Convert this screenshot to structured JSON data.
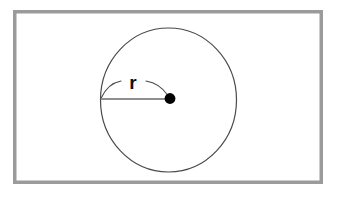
{
  "figure": {
    "kind": "geometry-diagram",
    "width": 339,
    "height": 200,
    "background_color": "#ffffff"
  },
  "frame": {
    "name": "outer-border",
    "x": 13,
    "y": 10,
    "width": 310,
    "height": 174,
    "stroke_color": "#9b9b9b",
    "stroke_width": 3.5,
    "fill_color": "#ffffff"
  },
  "circle": {
    "name": "circle-outline",
    "center_x": 168.5,
    "center_y": 100,
    "radius_x": 68,
    "radius_y": 72,
    "stroke_color": "#4a4a4a",
    "stroke_width": 1.2,
    "fill_color": "none"
  },
  "center_point": {
    "name": "center-dot",
    "x": 170,
    "y": 98.5,
    "radius": 5.4,
    "fill_color": "#000000"
  },
  "radius_line": {
    "name": "radius-segment",
    "x1": 100.8,
    "y1": 99,
    "x2": 170,
    "y2": 99,
    "stroke_color": "#8f8f8f",
    "stroke_width": 2.2
  },
  "radius_arc": {
    "name": "radius-dimension-arc",
    "left_segment_path": "M 101.5 97.5 Q 108 83.5 121 81",
    "right_segment_path": "M 146 81 Q 160 83.5 167.5 95",
    "stroke_color": "#4a4a4a",
    "stroke_width": 1.1,
    "fill_color": "none"
  },
  "labels": {
    "radius": {
      "name": "radius-label",
      "text": "r",
      "x": 133,
      "y": 89,
      "font_size": 19,
      "font_weight": "bold",
      "color": "#111111"
    }
  },
  "colors": {
    "border_gray": "#9b9b9b",
    "line_gray": "#8f8f8f",
    "outline_gray": "#4a4a4a",
    "dot_black": "#000000",
    "page_white": "#ffffff"
  }
}
